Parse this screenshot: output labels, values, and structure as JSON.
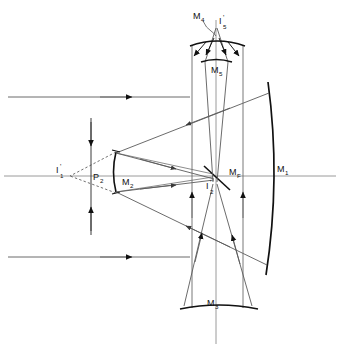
{
  "figure": {
    "type": "optical-ray-diagram",
    "title": "",
    "background_color": "#ffffff",
    "line_color": "#4a4a4a",
    "heavy_line_color": "#111111",
    "axis_color": "#8a8a8a",
    "label_color": "#111111",
    "width": 340,
    "height": 349
  },
  "labels": {
    "m1": {
      "text": "M",
      "sub": "1"
    },
    "m2": {
      "text": "M",
      "sub": "2"
    },
    "m3": {
      "text": "M",
      "sub": "3"
    },
    "m4": {
      "text": "M",
      "sub": "4"
    },
    "m5": {
      "text": "M",
      "sub": "5"
    },
    "mf": {
      "text": "M",
      "sub": "F"
    },
    "i1": {
      "text": "I",
      "sub": "1",
      "prime": "'"
    },
    "i2": {
      "text": "I",
      "sub": "2",
      "prime": "'"
    },
    "i5": {
      "text": "I",
      "sub": "5",
      "prime": "'"
    },
    "p2": {
      "text": "P",
      "sub": "2"
    }
  },
  "elements": [
    {
      "name": "m1-primary-mirror",
      "kind": "curved-mirror",
      "label": "M1",
      "orientation": "vertical-concave-left",
      "x": 272,
      "y_top": 82,
      "y_bottom": 275
    },
    {
      "name": "m2-secondary-mirror",
      "kind": "curved-mirror",
      "label": "M2",
      "orientation": "vertical-convex-left",
      "x": 114,
      "y_top": 152,
      "y_bottom": 192
    },
    {
      "name": "m3-tertiary-mirror",
      "kind": "curved-mirror",
      "label": "M3",
      "orientation": "horizontal-concave-up",
      "y": 308,
      "x_left": 180,
      "x_right": 258
    },
    {
      "name": "m4-mirror",
      "kind": "curved-mirror",
      "label": "M4",
      "orientation": "horizontal-concave-down",
      "y": 43,
      "x_left": 190,
      "x_right": 245
    },
    {
      "name": "m5-mirror",
      "kind": "curved-mirror",
      "label": "M5",
      "orientation": "horizontal-concave-up",
      "y": 62,
      "x_left": 201,
      "x_right": 232
    },
    {
      "name": "mf-fold-mirror",
      "kind": "flat-tilted-mirror",
      "label": "MF",
      "x": 215,
      "y": 176
    },
    {
      "name": "p2-principal-plane",
      "kind": "principal-plane",
      "label": "P2",
      "x": 91,
      "y_top": 118,
      "y_bottom": 235
    },
    {
      "name": "i1-image-point",
      "kind": "image-point",
      "label": "I'1",
      "x": 67,
      "y": 176
    },
    {
      "name": "i2-image-point",
      "kind": "image-point",
      "label": "I'2",
      "x": 213,
      "y": 183
    },
    {
      "name": "i5-image-point",
      "kind": "image-point",
      "label": "I'5",
      "x": 216,
      "y": 26
    }
  ],
  "axes": {
    "optical_axis_y": 176,
    "optical_axis_x_start": 4,
    "optical_axis_x_end": 336,
    "vertical_axis_x": 216,
    "vertical_axis_y_start": 20,
    "vertical_axis_y_end": 344
  },
  "rays": {
    "incoming_upper_y": 97,
    "incoming_lower_y": 257,
    "incoming_x_start": 8,
    "incoming_x_end": 168,
    "description": "Two parallel collimated input beams travelling left to right toward M1"
  }
}
